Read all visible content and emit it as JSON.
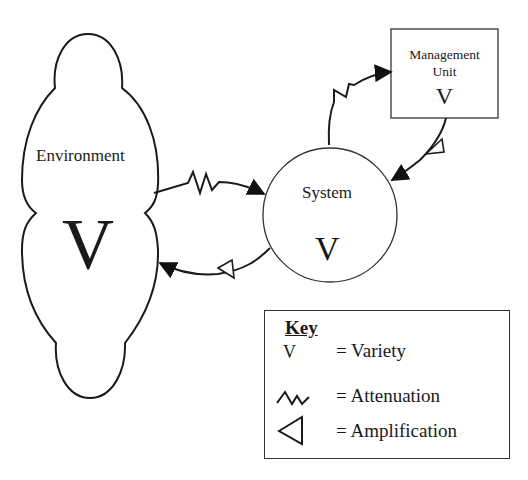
{
  "diagram": {
    "type": "viable-system-variety-diagram",
    "nodes": {
      "environment": {
        "label": "Environment",
        "variety_symbol": "V",
        "shape": "cloud"
      },
      "system": {
        "label": "System",
        "variety_symbol": "V",
        "shape": "circle"
      },
      "management_unit": {
        "label": "Management Unit",
        "label_lines": [
          "Management",
          "Unit"
        ],
        "variety_symbol": "V",
        "shape": "rectangle"
      }
    },
    "edges": [
      {
        "from": "environment",
        "to": "system",
        "modifier": "attenuation"
      },
      {
        "from": "system",
        "to": "environment",
        "modifier": "amplification"
      },
      {
        "from": "system",
        "to": "management_unit",
        "modifier": "attenuation"
      },
      {
        "from": "management_unit",
        "to": "system",
        "modifier": "amplification"
      }
    ]
  },
  "key": {
    "title": "Key",
    "items": [
      {
        "symbol": "V",
        "symbol_name": "variety-symbol",
        "label": "= Variety"
      },
      {
        "symbol": "zigzag",
        "symbol_name": "attenuation-icon",
        "label": "= Attenuation"
      },
      {
        "symbol": "open-triangle",
        "symbol_name": "amplification-icon",
        "label": "= Amplification"
      }
    ]
  },
  "colors": {
    "stroke": "#1a1a1a",
    "background": "#ffffff"
  }
}
